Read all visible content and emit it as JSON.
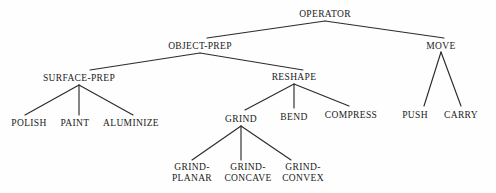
{
  "diagram": {
    "type": "tree",
    "background_color": "#fefefe",
    "text_color": "#1a1a1a",
    "edge_color": "#2b2b2b",
    "nodes": [
      {
        "id": "operator",
        "label": "OPERATOR",
        "x": 325,
        "y": 14,
        "level": 0,
        "parent": null
      },
      {
        "id": "object-prep",
        "label": "OBJECT-PREP",
        "x": 200,
        "y": 46,
        "level": 1,
        "parent": "operator"
      },
      {
        "id": "move",
        "label": "MOVE",
        "x": 441,
        "y": 46,
        "level": 1,
        "parent": "operator"
      },
      {
        "id": "surface-prep",
        "label": "SURFACE-PREP",
        "x": 79,
        "y": 78,
        "level": 2,
        "parent": "object-prep"
      },
      {
        "id": "reshape",
        "label": "RESHAPE",
        "x": 294,
        "y": 77,
        "level": 2,
        "parent": "object-prep"
      },
      {
        "id": "polish",
        "label": "POLISH",
        "x": 29,
        "y": 123,
        "level": 3,
        "parent": "surface-prep"
      },
      {
        "id": "paint",
        "label": "PAINT",
        "x": 75,
        "y": 123,
        "level": 3,
        "parent": "surface-prep"
      },
      {
        "id": "aluminize",
        "label": "ALUMINIZE",
        "x": 131,
        "y": 123,
        "level": 3,
        "parent": "surface-prep"
      },
      {
        "id": "grind",
        "label": "GRIND",
        "x": 241,
        "y": 119,
        "level": 3,
        "parent": "reshape"
      },
      {
        "id": "bend",
        "label": "BEND",
        "x": 294,
        "y": 117,
        "level": 3,
        "parent": "reshape"
      },
      {
        "id": "compress",
        "label": "COMPRESS",
        "x": 351,
        "y": 115,
        "level": 3,
        "parent": "reshape"
      },
      {
        "id": "push",
        "label": "PUSH",
        "x": 415,
        "y": 115,
        "level": 2,
        "parent": "move"
      },
      {
        "id": "carry",
        "label": "CARRY",
        "x": 461,
        "y": 115,
        "level": 2,
        "parent": "move"
      },
      {
        "id": "grind-planar",
        "label": "GRIND-",
        "label2": "PLANAR",
        "x": 192,
        "y": 172,
        "level": 4,
        "parent": "grind"
      },
      {
        "id": "grind-concave",
        "label": "GRIND-",
        "label2": "CONCAVE",
        "x": 248,
        "y": 172,
        "level": 4,
        "parent": "grind"
      },
      {
        "id": "grind-convex",
        "label": "GRIND-",
        "label2": "CONVEX",
        "x": 303,
        "y": 172,
        "level": 4,
        "parent": "grind"
      }
    ],
    "edges": [
      {
        "from": "operator",
        "to": "object-prep",
        "x1": 325,
        "y1": 21,
        "x2": 207,
        "y2": 38
      },
      {
        "from": "operator",
        "to": "move",
        "x1": 325,
        "y1": 21,
        "x2": 444,
        "y2": 38
      },
      {
        "from": "object-prep",
        "to": "surface-prep",
        "x1": 200,
        "y1": 53,
        "x2": 90,
        "y2": 70
      },
      {
        "from": "object-prep",
        "to": "reshape",
        "x1": 200,
        "y1": 53,
        "x2": 303,
        "y2": 70
      },
      {
        "from": "surface-prep",
        "to": "polish",
        "x1": 79,
        "y1": 85,
        "x2": 25,
        "y2": 115
      },
      {
        "from": "surface-prep",
        "to": "paint",
        "x1": 79,
        "y1": 85,
        "x2": 79,
        "y2": 115
      },
      {
        "from": "surface-prep",
        "to": "aluminize",
        "x1": 79,
        "y1": 85,
        "x2": 133,
        "y2": 115
      },
      {
        "from": "reshape",
        "to": "grind",
        "x1": 294,
        "y1": 84,
        "x2": 245,
        "y2": 110
      },
      {
        "from": "reshape",
        "to": "bend",
        "x1": 294,
        "y1": 84,
        "x2": 294,
        "y2": 108
      },
      {
        "from": "reshape",
        "to": "compress",
        "x1": 294,
        "y1": 84,
        "x2": 349,
        "y2": 106
      },
      {
        "from": "move",
        "to": "push",
        "x1": 441,
        "y1": 52,
        "x2": 424,
        "y2": 106
      },
      {
        "from": "move",
        "to": "carry",
        "x1": 441,
        "y1": 52,
        "x2": 461,
        "y2": 106
      },
      {
        "from": "grind",
        "to": "grind-planar",
        "x1": 241,
        "y1": 126,
        "x2": 192,
        "y2": 160
      },
      {
        "from": "grind",
        "to": "grind-concave",
        "x1": 241,
        "y1": 126,
        "x2": 241,
        "y2": 160
      },
      {
        "from": "grind",
        "to": "grind-convex",
        "x1": 241,
        "y1": 126,
        "x2": 291,
        "y2": 160
      }
    ]
  }
}
